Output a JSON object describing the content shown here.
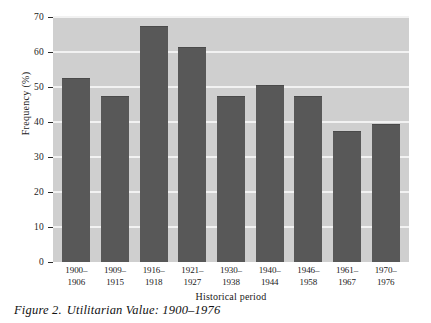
{
  "figure": {
    "caption_label": "Figure 2.",
    "caption_text": "Utilitarian Value: 1900–1976"
  },
  "chart_data": {
    "type": "bar",
    "title": "",
    "xlabel": "Historical period",
    "ylabel": "Frequency (%)",
    "ylim": [
      0,
      70
    ],
    "ytick_step": 10,
    "yticks": [
      0,
      10,
      20,
      30,
      40,
      50,
      60,
      70
    ],
    "ytick_labels": [
      "0",
      "10",
      "20",
      "30",
      "40",
      "50",
      "60",
      "70"
    ],
    "grid": "horizontal",
    "legend": "none",
    "categories": [
      "1900–1906",
      "1909–1915",
      "1916–1918",
      "1921–1927",
      "1930–1938",
      "1940–1944",
      "1946–1958",
      "1961–1967",
      "1970–1976"
    ],
    "category_lines": [
      [
        "1900–",
        "1906"
      ],
      [
        "1909–",
        "1915"
      ],
      [
        "1916–",
        "1918"
      ],
      [
        "1921–",
        "1927"
      ],
      [
        "1930–",
        "1938"
      ],
      [
        "1940–",
        "1944"
      ],
      [
        "1946–",
        "1958"
      ],
      [
        "1961–",
        "1967"
      ],
      [
        "1970–",
        "1976"
      ]
    ],
    "values": [
      52.5,
      47.5,
      67.5,
      61.5,
      47.5,
      50.5,
      47.5,
      37.5,
      39.5
    ],
    "colors": {
      "bar_fill": "#585858",
      "plot_background": "#cfcfcf",
      "gridline": "#f2f2f2",
      "page_background": "#ffffff",
      "text": "#1a1a1a"
    }
  }
}
